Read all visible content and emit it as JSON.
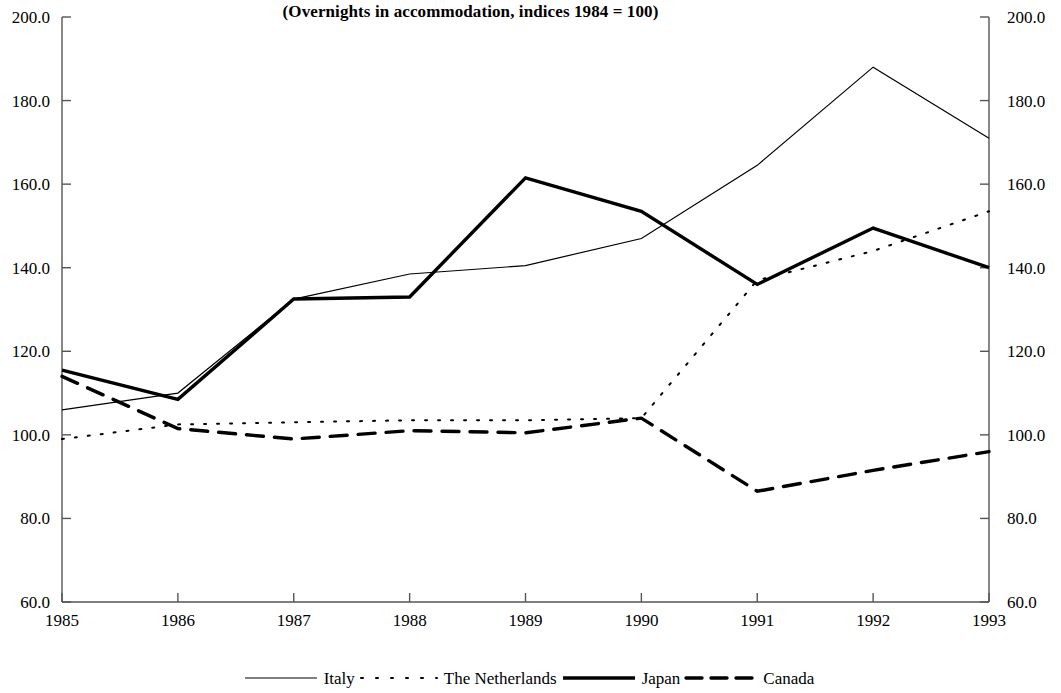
{
  "title": "(Overnights in accommodation, indices 1984 = 100)",
  "axis": {
    "y_ticks": [
      "200.0",
      "180.0",
      "160.0",
      "140.0",
      "120.0",
      "100.0",
      "80.0",
      "60.0"
    ],
    "x_ticks": [
      "1985",
      "1986",
      "1987",
      "1988",
      "1989",
      "1990",
      "1991",
      "1992",
      "1993"
    ]
  },
  "legend": {
    "items": [
      {
        "label": "Italy",
        "style": "thin-solid"
      },
      {
        "label": "The Netherlands",
        "style": "dotted"
      },
      {
        "label": "Japan",
        "style": "thick-solid"
      },
      {
        "label": "Canada",
        "style": "thick-dashed"
      }
    ]
  },
  "chart_data": {
    "type": "line",
    "title": "(Overnights in accommodation, indices 1984 = 100)",
    "xlabel": "",
    "ylabel": "",
    "x": [
      1985,
      1986,
      1987,
      1988,
      1989,
      1990,
      1991,
      1992,
      1993
    ],
    "xtick_labels": [
      "1985",
      "1986",
      "1987",
      "1988",
      "1989",
      "1990",
      "1991",
      "1992",
      "1993"
    ],
    "ylim": [
      60.0,
      200.0
    ],
    "ytick_values": [
      60.0,
      80.0,
      100.0,
      120.0,
      140.0,
      160.0,
      180.0,
      200.0
    ],
    "y_axis_both_sides": true,
    "grid": false,
    "legend_position": "bottom",
    "series": [
      {
        "name": "Italy",
        "line": "solid",
        "width": 1.2,
        "values": [
          106.0,
          110.0,
          132.5,
          138.5,
          140.5,
          147.0,
          164.5,
          188.0,
          171.0
        ]
      },
      {
        "name": "The Netherlands",
        "line": "dotted",
        "width": 2.0,
        "values": [
          99.0,
          102.5,
          103.0,
          103.5,
          103.5,
          104.0,
          137.0,
          144.0,
          153.5
        ]
      },
      {
        "name": "Japan",
        "line": "solid",
        "width": 3.4,
        "values": [
          115.5,
          108.5,
          132.5,
          133.0,
          161.5,
          153.5,
          136.0,
          149.5,
          140.0
        ]
      },
      {
        "name": "Canada",
        "line": "dashed",
        "width": 3.4,
        "values": [
          114.0,
          101.5,
          99.0,
          101.0,
          100.5,
          104.0,
          86.5,
          91.5,
          96.0
        ]
      }
    ]
  }
}
